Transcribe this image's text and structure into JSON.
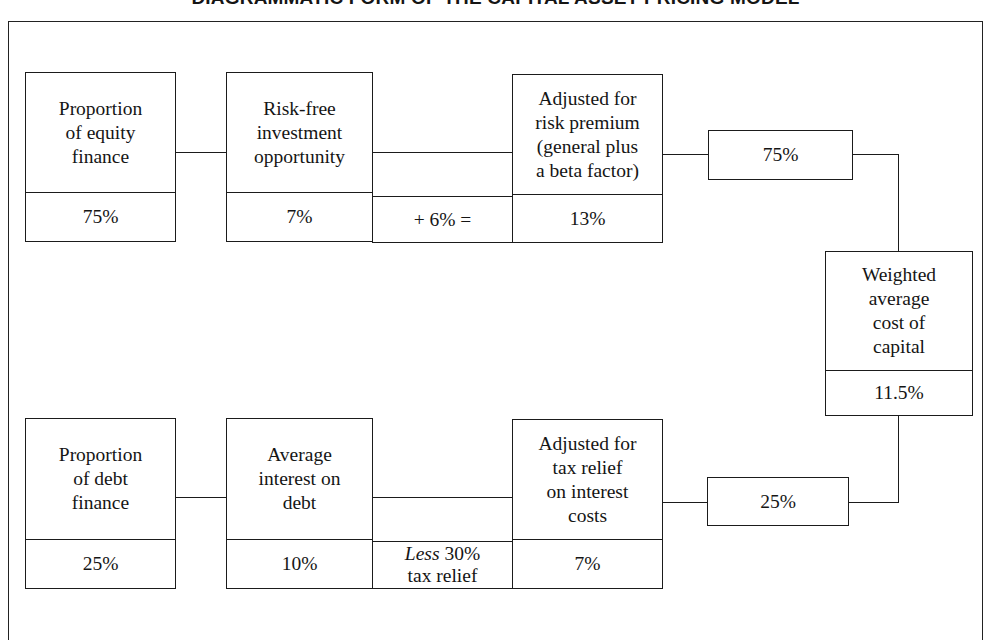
{
  "title": "DIAGRAMMATIC FORM OF THE CAPITAL ASSET PRICING MODEL",
  "equity_row": {
    "proportion": {
      "label": "Proportion\nof equity\nfinance",
      "value": "75%"
    },
    "riskfree": {
      "label": "Risk-free\ninvestment\nopportunity",
      "value": "7%"
    },
    "operator": {
      "text": "+ 6% ="
    },
    "adjusted": {
      "label": "Adjusted for\nrisk premium\n(general plus\na beta factor)",
      "value": "13%"
    },
    "weight": {
      "value": "75%"
    }
  },
  "debt_row": {
    "proportion": {
      "label": "Proportion\nof debt\nfinance",
      "value": "25%"
    },
    "interest": {
      "label": "Average\ninterest on\ndebt",
      "value": "10%"
    },
    "operator": {
      "emphasis": "Less",
      "text": " 30%\ntax relief"
    },
    "adjusted": {
      "label": "Adjusted for\ntax relief\non interest\ncosts",
      "value": "7%"
    },
    "weight": {
      "value": "25%"
    }
  },
  "result": {
    "label": "Weighted\naverage\ncost of\ncapital",
    "value": "11.5%"
  },
  "colors": {
    "line": "#1b1b1b",
    "text": "#151515",
    "background": "#ffffff"
  }
}
